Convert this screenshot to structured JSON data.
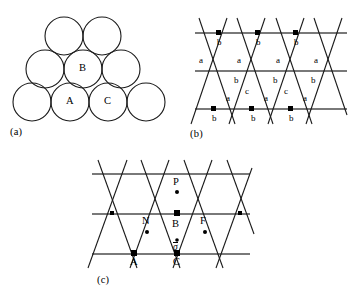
{
  "figure": {
    "panels": [
      {
        "id": "a",
        "caption": "(a)"
      },
      {
        "id": "b",
        "caption": "(b)"
      },
      {
        "id": "c",
        "caption": "(c)"
      }
    ]
  },
  "colors": {
    "stroke": "#1a1a1a",
    "background": "#ffffff",
    "marker": "#000000"
  },
  "panel_a": {
    "caption": "(a)",
    "description": "close-packed circle stack",
    "circle_radius": 19,
    "rows": [
      {
        "y": 30,
        "centers": [
          64,
          102
        ]
      },
      {
        "y": 66,
        "centers": [
          45,
          83,
          121
        ]
      },
      {
        "y": 102,
        "centers": [
          32,
          70,
          108,
          146
        ]
      }
    ],
    "labels": [
      {
        "text": "B",
        "x": 83,
        "y": 66
      },
      {
        "text": "A",
        "x": 70,
        "y": 102
      },
      {
        "text": "C",
        "x": 108,
        "y": 102
      }
    ]
  },
  "panel_b": {
    "caption": "(b)",
    "description": "triangular lattice with site labels",
    "labels": [
      {
        "text": "b",
        "x": 45,
        "y": 43
      },
      {
        "text": "b",
        "x": 83,
        "y": 43
      },
      {
        "text": "b",
        "x": 122,
        "y": 43
      },
      {
        "text": "a",
        "x": 27,
        "y": 61
      },
      {
        "text": "a",
        "x": 65,
        "y": 61
      },
      {
        "text": "a",
        "x": 104,
        "y": 61
      },
      {
        "text": "a",
        "x": 142,
        "y": 61
      },
      {
        "text": "b",
        "x": 62,
        "y": 81
      },
      {
        "text": "b",
        "x": 101,
        "y": 81
      },
      {
        "text": "b",
        "x": 139,
        "y": 81
      },
      {
        "text": "c",
        "x": 73,
        "y": 92
      },
      {
        "text": "c",
        "x": 112,
        "y": 92
      },
      {
        "text": "a",
        "x": 54,
        "y": 99
      },
      {
        "text": "a",
        "x": 92,
        "y": 99
      },
      {
        "text": "a",
        "x": 131,
        "y": 99
      },
      {
        "text": "b",
        "x": 40,
        "y": 119
      },
      {
        "text": "b",
        "x": 79,
        "y": 119
      },
      {
        "text": "b",
        "x": 117,
        "y": 119
      }
    ]
  },
  "panel_c": {
    "caption": "(c)",
    "description": "triangular lattice with marked sites and displacement vector",
    "labels": [
      {
        "text": "P",
        "x": 97,
        "y": 31,
        "marker": "dot"
      },
      {
        "text": "N",
        "x": 68,
        "y": 71,
        "marker": "dot"
      },
      {
        "text": "B",
        "x": 97,
        "y": 71,
        "marker": "square"
      },
      {
        "text": "F",
        "x": 122,
        "y": 71,
        "marker": "dot"
      },
      {
        "text": "A",
        "x": 73,
        "y": 113,
        "marker": "square"
      },
      {
        "text": "C",
        "x": 116,
        "y": 113,
        "marker": "square"
      }
    ],
    "vector_label": {
      "text": "σ",
      "x": 97,
      "y": 93,
      "has_overbar": true
    }
  }
}
